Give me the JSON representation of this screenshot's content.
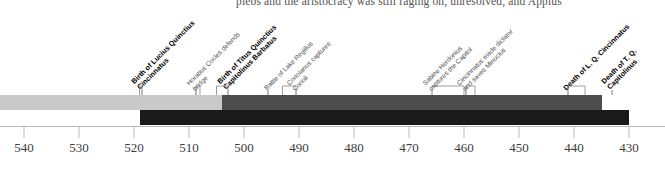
{
  "page": {
    "body_text": "plebs and the aristocracy was still raging on, unresolved, and Appius"
  },
  "chart_data": {
    "type": "timeline",
    "title": "",
    "xlabel": "",
    "ylabel": "",
    "axis": {
      "direction": "reversed",
      "era": "BC",
      "min": 430,
      "max": 545,
      "tick_step": 10,
      "ticks": [
        540,
        530,
        520,
        510,
        500,
        490,
        480,
        470,
        460,
        450,
        440,
        430
      ]
    },
    "bars": [
      {
        "name": "Lucius Quinctius Cincinnatus lifespan",
        "start": 519,
        "end": 430,
        "color": "#1a1a1a",
        "row": 1
      },
      {
        "name": "Titus Quinctius Capitolinus Barbatus lifespan",
        "start": 545,
        "end": 435,
        "color": "#c9c9c9",
        "row": 0
      },
      {
        "name": "Cincinnatus active period",
        "start": 504,
        "end": 435,
        "color": "#4d4d4d",
        "row": 0
      }
    ],
    "events": [
      {
        "label_lines": [
          "Birth of Lucius Quinctius",
          "Cincinnatus"
        ],
        "year": 519,
        "bold": true
      },
      {
        "label_lines": [
          "Horatius Cocles defends",
          "bridge"
        ],
        "year": 508,
        "bold": false
      },
      {
        "label_lines": [
          "Birth of Titus Quinctius",
          "Capitolinus Barbatus"
        ],
        "year": 505,
        "bold": true
      },
      {
        "label_lines": [
          "Battle of Lake Regillus"
        ],
        "year": 496,
        "bold": false
      },
      {
        "label_lines": [
          "Coriolanus captures",
          "Corioli"
        ],
        "year": 493,
        "bold": false
      },
      {
        "label_lines": [
          "Sabine Herdonius",
          "captures the Capitol"
        ],
        "year": 460,
        "bold": false
      },
      {
        "label_lines": [
          "Cincinnatus made dictator",
          "and saves Minucius"
        ],
        "year": 458,
        "bold": false
      },
      {
        "label_lines": [
          "Death of L. Q. Cincinnatus"
        ],
        "year": 438,
        "bold": true
      },
      {
        "label_lines": [
          "Death of T. Q.",
          "Capitolinus"
        ],
        "year": 433,
        "bold": true
      }
    ]
  }
}
